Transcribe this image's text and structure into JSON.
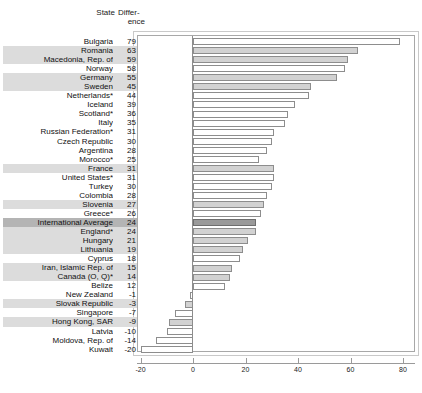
{
  "header": {
    "col_state": "State",
    "col_difference_line1": "Differ-",
    "col_difference_line2": "ence"
  },
  "chart_data": {
    "type": "bar",
    "orientation": "horizontal",
    "title": "",
    "xlabel": "",
    "ylabel": "",
    "xlim": [
      -20,
      80
    ],
    "xticks": [
      -20,
      0,
      20,
      40,
      60,
      80
    ],
    "xticklabels": [
      "-20",
      "0",
      "20",
      "40",
      "60",
      "80"
    ],
    "grid": false,
    "legend": "none",
    "categories": [
      "Bulgaria",
      "Romania",
      "Macedonia, Rep. of",
      "Norway",
      "Germany",
      "Sweden",
      "Netherlands*",
      "Iceland",
      "Scotland*",
      "Italy",
      "Russian Federation*",
      "Czech Republic",
      "Argentina",
      "Morocco*",
      "France",
      "United States*",
      "Turkey",
      "Colombia",
      "Slovenia",
      "Greece*",
      "International Average",
      "England*",
      "Hungary",
      "Lithuania",
      "Cyprus",
      "Iran, Islamic Rep. of",
      "Canada (O, Q)*",
      "Belize",
      "New Zealand",
      "Slovak Republic",
      "Singapore",
      "Hong Kong, SAR",
      "Latvia",
      "Moldova, Rep. of",
      "Kuwait"
    ],
    "values": [
      79,
      63,
      59,
      58,
      55,
      45,
      44,
      39,
      36,
      35,
      31,
      30,
      28,
      25,
      31,
      31,
      30,
      28,
      27,
      26,
      24,
      24,
      21,
      19,
      18,
      15,
      14,
      12,
      -1,
      -3,
      -7,
      -9,
      -10,
      -14,
      -20
    ],
    "row_styles": [
      "plain",
      "shaded",
      "shaded",
      "plain",
      "shaded",
      "shaded",
      "plain",
      "plain",
      "plain",
      "plain",
      "plain",
      "plain",
      "plain",
      "plain",
      "shaded",
      "plain",
      "plain",
      "plain",
      "shaded",
      "plain",
      "average",
      "shaded",
      "shaded",
      "shaded",
      "plain",
      "shaded",
      "shaded",
      "plain",
      "plain",
      "shaded",
      "plain",
      "shaded",
      "plain",
      "plain",
      "plain"
    ]
  },
  "colors": {
    "row_shade": "#dcdcdc",
    "row_average_shade": "#b4b4b4",
    "bar_fill_plain": "#ffffff",
    "bar_fill_shaded": "#d2d2d2",
    "bar_fill_average": "#9a9a9a",
    "bar_outline": "#8d8d8d",
    "frame": "#a8a8a8",
    "text": "#111111"
  }
}
